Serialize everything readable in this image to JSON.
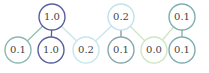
{
  "diagram": {
    "type": "tree",
    "top_nodes": [
      {
        "id": "t0",
        "label": "1.0",
        "x": 52,
        "y": 17,
        "color": "#5a5f9e"
      },
      {
        "id": "t1",
        "label": "0.2",
        "x": 121,
        "y": 17,
        "color": "#bfe3ea"
      },
      {
        "id": "t2",
        "label": "0.1",
        "x": 182,
        "y": 17,
        "color": "#7faeb0"
      }
    ],
    "bottom_nodes": [
      {
        "id": "b0",
        "label": "0.1",
        "x": 18,
        "y": 50,
        "color": "#8db7b3"
      },
      {
        "id": "b1",
        "label": "1.0",
        "x": 51,
        "y": 50,
        "color": "#5a5f9e"
      },
      {
        "id": "b2",
        "label": "0.2",
        "x": 86,
        "y": 50,
        "color": "#c7e6ec"
      },
      {
        "id": "b3",
        "label": "0.1",
        "x": 121,
        "y": 50,
        "color": "#8aa7ae"
      },
      {
        "id": "b4",
        "label": "0.0",
        "x": 154,
        "y": 50,
        "color": "#cfe6c4"
      },
      {
        "id": "b5",
        "label": "0.1",
        "x": 182,
        "y": 50,
        "color": "#7faeb0"
      }
    ],
    "edges": [
      {
        "from": "t0",
        "to": "b0",
        "color": "#8fc2b0"
      },
      {
        "from": "t0",
        "to": "b1",
        "color": "#5a5f9e"
      },
      {
        "from": "t0",
        "to": "b2",
        "color": "#c7e6ec"
      },
      {
        "from": "t1",
        "to": "b2",
        "color": "#c7e6ec"
      },
      {
        "from": "t1",
        "to": "b3",
        "color": "#7f97a8"
      },
      {
        "from": "t1",
        "to": "b4",
        "color": "#cfe6c4"
      },
      {
        "from": "t2",
        "to": "b4",
        "color": "#cfe6c4"
      },
      {
        "from": "t2",
        "to": "b5",
        "color": "#7faeb0"
      }
    ],
    "node_radius": 13
  }
}
